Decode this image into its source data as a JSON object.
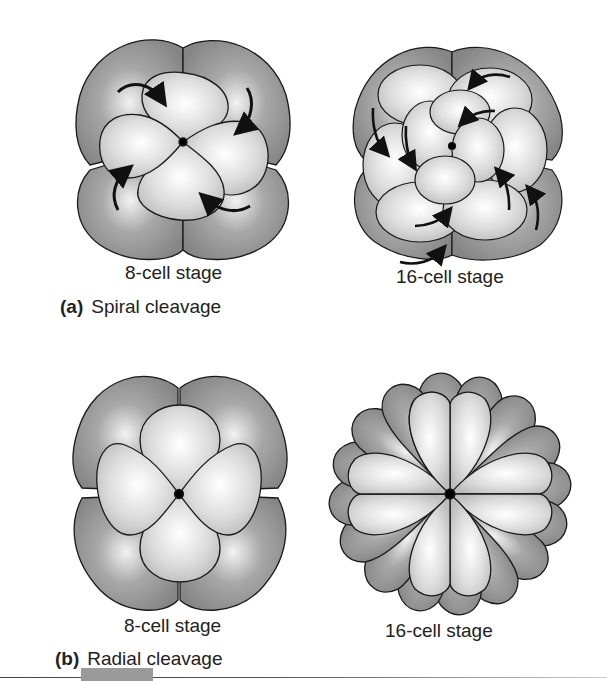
{
  "panels": [
    {
      "id": "a",
      "letter": "(a)",
      "title": "Spiral cleavage",
      "stages": [
        {
          "label": "8-cell stage",
          "cells": 8,
          "arrows": 4
        },
        {
          "label": "16-cell stage",
          "cells": 16,
          "arrows": 8
        }
      ]
    },
    {
      "id": "b",
      "letter": "(b)",
      "title": "Radial cleavage",
      "stages": [
        {
          "label": "8-cell stage",
          "cells": 8
        },
        {
          "label": "16-cell stage",
          "cells": 16
        }
      ]
    }
  ],
  "colors": {
    "outer_cell": "#8c8c8c",
    "inner_cell": "#d9d9d9",
    "highlight": "#ffffff",
    "outline": "#1a1a1a",
    "footer_tab": "#9a9a9a"
  }
}
